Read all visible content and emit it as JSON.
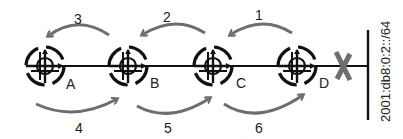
{
  "diagram": {
    "routers": [
      {
        "id": "A",
        "label": "A",
        "cx": 45,
        "cy": 66
      },
      {
        "id": "B",
        "label": "B",
        "cx": 128,
        "cy": 66
      },
      {
        "id": "C",
        "label": "C",
        "cx": 213,
        "cy": 66
      },
      {
        "id": "D",
        "label": "D",
        "cx": 297,
        "cy": 66
      }
    ],
    "arrows": [
      {
        "label": "1",
        "direction": "D to C",
        "position": "top"
      },
      {
        "label": "2",
        "direction": "C to B",
        "position": "top"
      },
      {
        "label": "3",
        "direction": "B to A",
        "position": "top"
      },
      {
        "label": "4",
        "direction": "A to B",
        "position": "bottom"
      },
      {
        "label": "5",
        "direction": "B to C",
        "position": "bottom"
      },
      {
        "label": "6",
        "direction": "C to D",
        "position": "bottom"
      }
    ],
    "failure_mark": "X",
    "subnet": "2001:db8:0:2::/64",
    "colors": {
      "line": "#111111",
      "arrow": "#6e6e6e",
      "failure": "#6e6e6e"
    }
  }
}
